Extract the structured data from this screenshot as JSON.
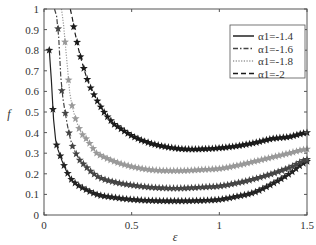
{
  "chart_data": {
    "type": "line",
    "title": "",
    "xlabel": "ε",
    "ylabel": "f",
    "xlim": [
      0,
      1.5
    ],
    "ylim": [
      0,
      1
    ],
    "xticks": [
      "0",
      "0.5",
      "1",
      "1.5"
    ],
    "yticks": [
      "0",
      "0.1",
      "0.2",
      "0.3",
      "0.4",
      "0.5",
      "0.6",
      "0.7",
      "0.8",
      "0.9",
      "1"
    ],
    "grid": false,
    "legend_position": "upper right",
    "marker": "star",
    "series": [
      {
        "name": "α1=-1.4",
        "style": "solid",
        "color": "#222222",
        "x": [
          0.03,
          0.06,
          0.1,
          0.15,
          0.2,
          0.3,
          0.4,
          0.5,
          0.6,
          0.7,
          0.8,
          0.9,
          1.0,
          1.1,
          1.2,
          1.3,
          1.4,
          1.5
        ],
        "y": [
          0.8,
          0.4,
          0.27,
          0.18,
          0.14,
          0.1,
          0.085,
          0.075,
          0.07,
          0.068,
          0.068,
          0.07,
          0.075,
          0.09,
          0.11,
          0.15,
          0.2,
          0.26
        ]
      },
      {
        "name": "α1=-1.6",
        "style": "dashdot",
        "color": "#444444",
        "x": [
          0.06,
          0.08,
          0.1,
          0.15,
          0.2,
          0.3,
          0.4,
          0.5,
          0.6,
          0.7,
          0.8,
          0.9,
          1.0,
          1.1,
          1.2,
          1.3,
          1.4,
          1.5
        ],
        "y": [
          1.0,
          0.91,
          0.61,
          0.37,
          0.27,
          0.19,
          0.16,
          0.145,
          0.135,
          0.13,
          0.13,
          0.135,
          0.14,
          0.155,
          0.175,
          0.2,
          0.23,
          0.27
        ]
      },
      {
        "name": "α1=-1.8",
        "style": "dotted",
        "color": "#999999",
        "x": [
          0.1,
          0.12,
          0.15,
          0.2,
          0.25,
          0.3,
          0.4,
          0.5,
          0.6,
          0.7,
          0.8,
          0.9,
          1.0,
          1.1,
          1.2,
          1.3,
          1.4,
          1.5
        ],
        "y": [
          1.0,
          0.84,
          0.57,
          0.42,
          0.36,
          0.3,
          0.26,
          0.235,
          0.22,
          0.215,
          0.215,
          0.22,
          0.225,
          0.24,
          0.26,
          0.28,
          0.3,
          0.32
        ]
      },
      {
        "name": "α1=-2",
        "style": "dashed",
        "color": "#1a1a1a",
        "x": [
          0.15,
          0.17,
          0.2,
          0.25,
          0.3,
          0.35,
          0.4,
          0.5,
          0.6,
          0.7,
          0.8,
          0.9,
          1.0,
          1.1,
          1.2,
          1.3,
          1.4,
          1.5
        ],
        "y": [
          1.0,
          0.91,
          0.79,
          0.65,
          0.56,
          0.49,
          0.44,
          0.385,
          0.35,
          0.33,
          0.32,
          0.32,
          0.325,
          0.335,
          0.35,
          0.37,
          0.38,
          0.4
        ]
      }
    ]
  },
  "axes": {
    "xlabel": "ε",
    "ylabel": "f"
  },
  "legend": {
    "items": [
      "α1=-1.4",
      "α1=-1.6",
      "α1=-1.8",
      "α1=-2"
    ]
  }
}
